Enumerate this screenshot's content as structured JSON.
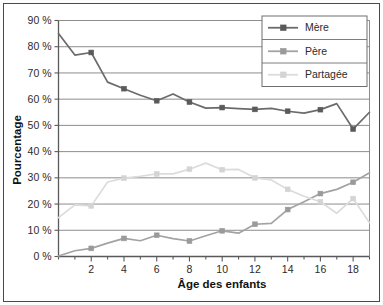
{
  "chart_data": {
    "type": "line",
    "title": "",
    "xlabel": "Âge des enfants",
    "ylabel": "Pourcentage",
    "xlim": [
      0,
      19
    ],
    "ylim": [
      0,
      90
    ],
    "grid": true,
    "grid_axis": "y",
    "legend_position": "top-right",
    "x": [
      0,
      1,
      2,
      3,
      4,
      5,
      6,
      7,
      8,
      9,
      10,
      11,
      12,
      13,
      14,
      15,
      16,
      17,
      18,
      19
    ],
    "x_tick_labels": [
      "2",
      "4",
      "6",
      "8",
      "10",
      "12",
      "14",
      "16",
      "18"
    ],
    "x_tick_values": [
      2,
      4,
      6,
      8,
      10,
      12,
      14,
      16,
      18
    ],
    "y_tick_labels": [
      "0 %",
      "10 %",
      "20 %",
      "30 %",
      "40 %",
      "50 %",
      "60 %",
      "70 %",
      "80 %",
      "90 %"
    ],
    "y_tick_values": [
      0,
      10,
      20,
      30,
      40,
      50,
      60,
      70,
      80,
      90
    ],
    "series": [
      {
        "name": "Mère",
        "color": "#6b6b6b",
        "marker": "square",
        "marker_color": "#5a5a5a",
        "values": [
          85.0,
          76.8,
          77.8,
          66.5,
          64.0,
          61.5,
          59.4,
          62.0,
          58.9,
          56.6,
          56.8,
          56.4,
          56.1,
          56.5,
          55.4,
          54.7,
          56.0,
          58.3,
          48.6,
          55.0
        ]
      },
      {
        "name": "Père",
        "color": "#a3a3a3",
        "marker": "square",
        "marker_color": "#9a9a9a",
        "values": [
          0.2,
          2.2,
          3.1,
          5.1,
          6.9,
          6.0,
          8.1,
          6.8,
          5.9,
          7.9,
          9.8,
          8.9,
          12.3,
          12.6,
          17.9,
          20.9,
          24.0,
          25.6,
          28.3,
          31.9
        ]
      },
      {
        "name": "Partagée",
        "color": "#dcdcdc",
        "marker": "square",
        "marker_color": "#d4d4d4",
        "values": [
          14.8,
          19.7,
          19.3,
          28.4,
          29.9,
          30.6,
          31.5,
          31.5,
          33.3,
          35.6,
          33.1,
          33.2,
          30.0,
          29.2,
          25.6,
          23.0,
          20.9,
          16.5,
          22.1,
          12.9
        ]
      }
    ]
  },
  "legend": {
    "items": [
      {
        "label": "Mère"
      },
      {
        "label": "Père"
      },
      {
        "label": "Partagée"
      }
    ]
  }
}
